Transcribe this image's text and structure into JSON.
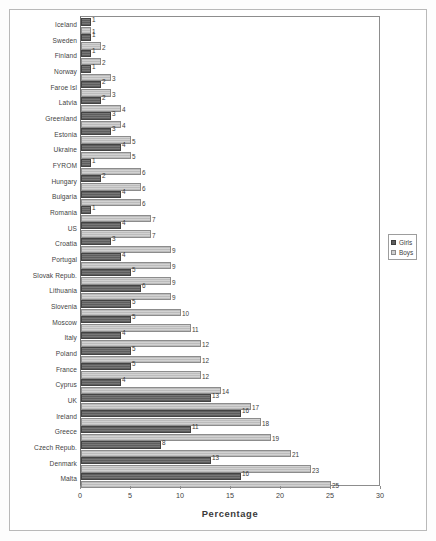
{
  "chart_data": {
    "type": "bar",
    "orientation": "horizontal",
    "title": "",
    "xlabel": "Percentage",
    "ylabel": "",
    "xlim": [
      0,
      30
    ],
    "xticks": [
      0,
      5,
      10,
      15,
      20,
      25,
      30
    ],
    "xtick_labels": [
      "0",
      "5",
      "10",
      "15",
      "20",
      "25",
      "30"
    ],
    "grid": false,
    "legend_position": "right",
    "categories": [
      "Iceland",
      "Sweden",
      "Finland",
      "Norway",
      "Faroe Isl",
      "Latvia",
      "Greenland",
      "Estonia",
      "Ukraine",
      "FYROM",
      "Hungary",
      "Bulgaria",
      "Romania",
      "US",
      "Croatia",
      "Portugal",
      "Slovak Repub.",
      "Lithuania",
      "Slovenia",
      "Moscow",
      "Italy",
      "Poland",
      "France",
      "Cyprus",
      "UK",
      "Ireland",
      "Greece",
      "Czech Repub.",
      "Denmark",
      "Malta"
    ],
    "series": [
      {
        "name": "Girls",
        "color": "#6a6a6a",
        "values": [
          1,
          1,
          1,
          1,
          2,
          2,
          3,
          3,
          4,
          1,
          2,
          4,
          1,
          4,
          3,
          4,
          5,
          6,
          5,
          5,
          4,
          5,
          5,
          4,
          13,
          16,
          11,
          8,
          13,
          16
        ]
      },
      {
        "name": "Boys",
        "color": "#c3c3c3",
        "values": [
          1,
          2,
          2,
          3,
          3,
          4,
          4,
          5,
          5,
          6,
          6,
          6,
          7,
          7,
          9,
          9,
          9,
          9,
          10,
          11,
          12,
          12,
          12,
          14,
          17,
          18,
          19,
          21,
          23,
          25
        ]
      }
    ],
    "legend": [
      {
        "label": "Girls",
        "swatch": "dark-hatched"
      },
      {
        "label": "Boys",
        "swatch": "light-hatched"
      }
    ]
  }
}
